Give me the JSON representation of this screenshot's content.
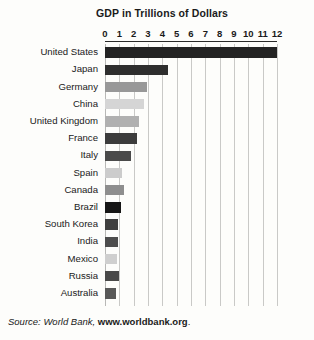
{
  "chart_data": {
    "type": "bar",
    "orientation": "horizontal",
    "title": "GDP in Trillions of Dollars",
    "xlabel": "",
    "ylabel": "",
    "xlim": [
      0,
      12
    ],
    "xticks": [
      0,
      1,
      2,
      3,
      4,
      5,
      6,
      7,
      8,
      9,
      10,
      11,
      12
    ],
    "xtick_labels": [
      "0",
      "1",
      "2",
      "3",
      "4",
      "5",
      "6",
      "7",
      "8",
      "9",
      "10",
      "11",
      "12"
    ],
    "grid": true,
    "legend": "none",
    "categories": [
      "United States",
      "Japan",
      "Germany",
      "China",
      "United Kingdom",
      "France",
      "Italy",
      "Spain",
      "Canada",
      "Brazil",
      "South Korea",
      "India",
      "Mexico",
      "Russia",
      "Australia"
    ],
    "values": [
      12.0,
      4.4,
      2.9,
      2.7,
      2.4,
      2.2,
      1.8,
      1.2,
      1.3,
      1.1,
      0.9,
      0.9,
      0.85,
      0.98,
      0.78
    ],
    "bar_colors": [
      "#232323",
      "#2e2e2e",
      "#989898",
      "#d5d5d5",
      "#b0b0b0",
      "#3c3c3c",
      "#4a4a4a",
      "#cccccc",
      "#8e8e8e",
      "#161616",
      "#3f3f3f",
      "#4d4d4d",
      "#cfcfcf",
      "#494949",
      "#585858"
    ],
    "source_note": {
      "prefix": "Source: World Bank, ",
      "url": "www.worldbank.org",
      "suffix": "."
    }
  },
  "style": {
    "background": "#fdfdfb",
    "gridline_color": "#c9c9c7",
    "axis_color": "#2a2a2a",
    "text_color": "#1a1a1a"
  }
}
